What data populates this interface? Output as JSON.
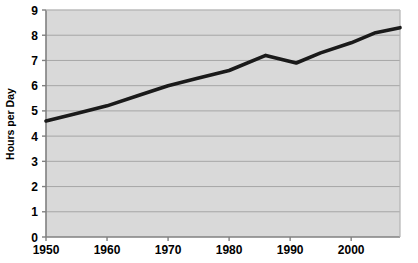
{
  "chart_data": {
    "type": "line",
    "title": "",
    "xlabel": "",
    "ylabel": "Hours per Day",
    "xlim": [
      1950,
      2008
    ],
    "ylim": [
      0,
      9
    ],
    "xticks": [
      1950,
      1960,
      1970,
      1980,
      1990,
      2000
    ],
    "yticks": [
      0,
      1,
      2,
      3,
      4,
      5,
      6,
      7,
      8,
      9
    ],
    "grid": "horizontal",
    "legend": "none",
    "line_color": "#1a1a1a",
    "plot_background": "#d9d9d9",
    "gridline_color": "#a6a6a6",
    "series": [
      {
        "name": "Hours per Day",
        "x": [
          1950,
          1955,
          1960,
          1965,
          1970,
          1975,
          1980,
          1986,
          1991,
          1995,
          2000,
          2004,
          2008
        ],
        "values": [
          4.6,
          4.9,
          5.2,
          5.6,
          6.0,
          6.3,
          6.6,
          7.2,
          6.9,
          7.3,
          7.7,
          8.1,
          8.3
        ]
      }
    ]
  },
  "axis": {
    "y_title": "Hours per Day",
    "y_tick_labels": [
      "9",
      "8",
      "7",
      "6",
      "5",
      "4",
      "3",
      "2",
      "1",
      "0"
    ],
    "x_tick_labels": [
      "1950",
      "1960",
      "1970",
      "1980",
      "1990",
      "2000"
    ]
  }
}
